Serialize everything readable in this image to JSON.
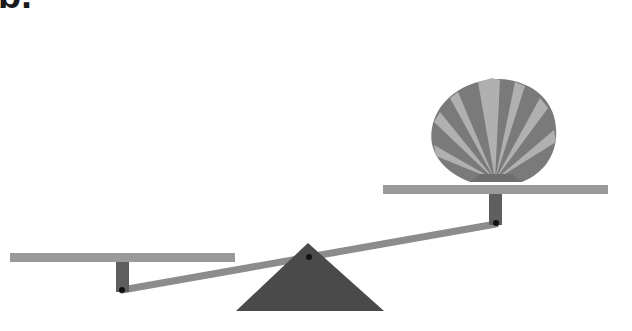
{
  "figure": {
    "label": "b."
  },
  "colors": {
    "platform": "#9a9a9a",
    "post": "#5e5e5e",
    "beam": "#8c8c8c",
    "fulcrum": "#4a4a4a",
    "shell_dark": "#7a7a7a",
    "shell_light": "#b0b0b0",
    "pivot_dot": "#111111"
  }
}
